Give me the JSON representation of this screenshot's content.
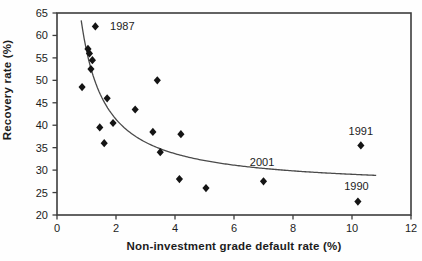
{
  "figure": {
    "background": "#fefefe",
    "axis_color": "#3d3d3d",
    "text_color": "#1c1c1c"
  },
  "chart_data": {
    "type": "scatter",
    "title": "",
    "xlabel": "Non-investment grade default rate (%)",
    "ylabel": "Recovery rate (%)",
    "xlim": [
      0,
      12
    ],
    "ylim": [
      20,
      65
    ],
    "xticks": [
      0,
      2,
      4,
      6,
      8,
      10,
      12
    ],
    "yticks": [
      20,
      25,
      30,
      35,
      40,
      45,
      50,
      55,
      60,
      65
    ],
    "grid": false,
    "legend": null,
    "marker": {
      "shape": "diamond",
      "color": "#141414",
      "size": 7
    },
    "points": [
      {
        "x": 0.85,
        "y": 48.5
      },
      {
        "x": 1.05,
        "y": 57.0
      },
      {
        "x": 1.1,
        "y": 56.0
      },
      {
        "x": 1.2,
        "y": 54.5
      },
      {
        "x": 1.15,
        "y": 52.5
      },
      {
        "x": 1.3,
        "y": 62.0,
        "year": "1987"
      },
      {
        "x": 1.45,
        "y": 39.5
      },
      {
        "x": 1.6,
        "y": 36.0
      },
      {
        "x": 1.7,
        "y": 46.0
      },
      {
        "x": 1.9,
        "y": 40.5
      },
      {
        "x": 2.65,
        "y": 43.5
      },
      {
        "x": 3.25,
        "y": 38.5
      },
      {
        "x": 3.4,
        "y": 50.0
      },
      {
        "x": 3.5,
        "y": 34.0
      },
      {
        "x": 4.2,
        "y": 38.0
      },
      {
        "x": 4.15,
        "y": 28.0
      },
      {
        "x": 5.05,
        "y": 26.0
      },
      {
        "x": 7.0,
        "y": 27.5,
        "year": "2001"
      },
      {
        "x": 10.3,
        "y": 35.5,
        "year": "1991"
      },
      {
        "x": 10.2,
        "y": 23.0,
        "year": "1990"
      }
    ],
    "trendline": {
      "type": "hyperbolic",
      "formula": "y = 26 + 30.65 / x",
      "a": 26,
      "b": 30.65,
      "x_start": 0.82,
      "x_end": 10.85,
      "color": "#4a4a4a"
    },
    "annotations": [
      {
        "text": "1987",
        "x": 1.8,
        "y": 62.0,
        "anchor": "start"
      },
      {
        "text": "2001",
        "x": 6.95,
        "y": 31.9,
        "anchor": "middle"
      },
      {
        "text": "1991",
        "x": 10.3,
        "y": 38.7,
        "anchor": "middle"
      },
      {
        "text": "1990",
        "x": 10.15,
        "y": 26.5,
        "anchor": "middle"
      }
    ]
  }
}
